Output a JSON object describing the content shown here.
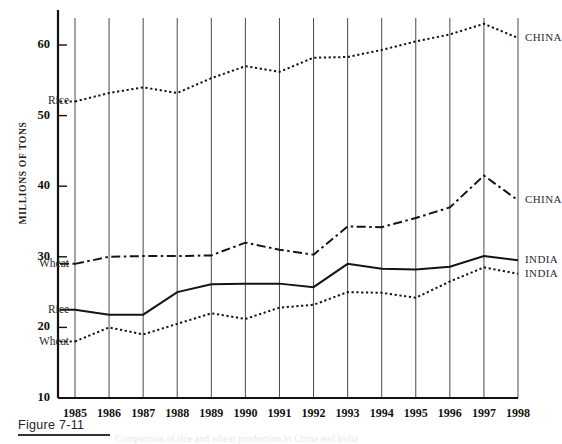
{
  "figure": {
    "caption_label": "Figure 7-11",
    "ghost_text": "Comparison of rice and wheat production in China and India"
  },
  "axis": {
    "y_title": "MILLIONS OF TONS",
    "y_ticks": [
      "60",
      "50",
      "40",
      "30",
      "20",
      "10"
    ],
    "x_ticks": [
      "1985",
      "1986",
      "1987",
      "1988",
      "1989",
      "1990",
      "1991",
      "1992",
      "1993",
      "1994",
      "1995",
      "1996",
      "1997",
      "1998"
    ]
  },
  "labels": {
    "left": [
      {
        "text": "Rice",
        "series": "china-rice"
      },
      {
        "text": "Wheat",
        "series": "china-wheat"
      },
      {
        "text": "Rice",
        "series": "india-rice"
      },
      {
        "text": "Wheat",
        "series": "india-wheat"
      }
    ],
    "right": [
      {
        "text": "CHINA",
        "series": "china-rice"
      },
      {
        "text": "CHINA",
        "series": "china-wheat"
      },
      {
        "text": "INDIA",
        "series": "india-rice"
      },
      {
        "text": "INDIA",
        "series": "india-wheat"
      }
    ]
  },
  "colors": {
    "line": "#141414",
    "gridline": "#4a4a4a",
    "axis": "#111111",
    "text": "#1a1a1a"
  },
  "chart_data": {
    "type": "line",
    "title": "Figure 7-11",
    "xlabel": "",
    "ylabel": "MILLIONS OF TONS",
    "ylim": [
      10,
      65
    ],
    "grid": true,
    "legend": "inline-end-labels",
    "x": [
      1985,
      1986,
      1987,
      1988,
      1989,
      1990,
      1991,
      1992,
      1993,
      1994,
      1995,
      1996,
      1997,
      1998
    ],
    "series": [
      {
        "name": "CHINA Rice",
        "country": "CHINA",
        "crop": "Rice",
        "style": "dotted",
        "left_label": "Rice",
        "right_label": "CHINA",
        "values": [
          52.0,
          53.2,
          54.0,
          53.2,
          55.3,
          57.0,
          56.2,
          58.2,
          58.3,
          59.3,
          60.5,
          61.5,
          63.0,
          61.0
        ]
      },
      {
        "name": "CHINA Wheat",
        "country": "CHINA",
        "crop": "Wheat",
        "style": "dash-dot",
        "left_label": "Wheat",
        "right_label": "CHINA",
        "values": [
          29.0,
          30.0,
          30.1,
          30.1,
          30.2,
          32.0,
          31.0,
          30.3,
          34.3,
          34.2,
          35.5,
          37.0,
          41.5,
          38.0
        ]
      },
      {
        "name": "INDIA Rice",
        "country": "INDIA",
        "crop": "Rice",
        "style": "solid",
        "left_label": "Rice",
        "right_label": "INDIA",
        "values": [
          22.5,
          21.8,
          21.8,
          25.0,
          26.1,
          26.2,
          26.2,
          25.7,
          29.0,
          28.3,
          28.2,
          28.6,
          30.1,
          29.5
        ]
      },
      {
        "name": "INDIA Wheat",
        "country": "INDIA",
        "crop": "Wheat",
        "style": "dotted",
        "left_label": "Wheat",
        "right_label": "INDIA",
        "values": [
          18.0,
          20.0,
          19.0,
          20.5,
          22.0,
          21.2,
          22.8,
          23.2,
          25.0,
          24.9,
          24.2,
          26.5,
          28.5,
          27.6
        ]
      }
    ]
  }
}
